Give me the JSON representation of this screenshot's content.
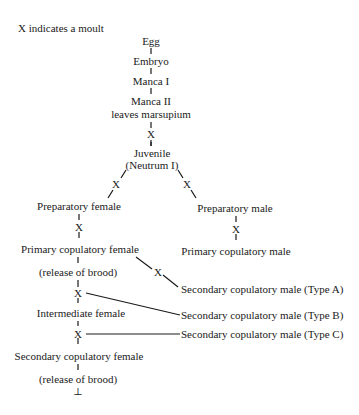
{
  "legend": "X indicates a moult",
  "moult_symbol": "X",
  "nodes": {
    "egg": "Egg",
    "embryo": "Embryo",
    "manca1": "Manca I",
    "manca2": "Manca II",
    "manca2_note": "leaves marsupium",
    "juvenile": "Juvenile",
    "juvenile_note": "(Neutrum I)",
    "prep_female": "Preparatory female",
    "prep_male": "Preparatory male",
    "prim_cop_female": "Primary copulatory female",
    "prim_cop_male": "Primary copulatory male",
    "release1": "(release of brood)",
    "intermediate_female": "Intermediate female",
    "sec_cop_female": "Secondary copulatory female",
    "release2": "(release of brood)",
    "sec_male_a": "Secondary copulatory male (Type A)",
    "sec_male_b": "Secondary copulatory male (Type B)",
    "sec_male_c": "Secondary copulatory male (Type C)",
    "end_symbol": "⊥"
  }
}
